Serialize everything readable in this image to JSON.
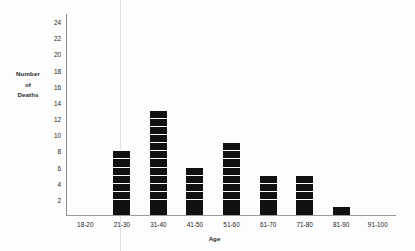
{
  "chart_data": {
    "type": "bar",
    "title": "",
    "xlabel": "Age",
    "ylabel": "Number of Deaths",
    "ylabel_lines": [
      "Number",
      "of",
      "Deaths"
    ],
    "categories": [
      "18-20",
      "21-30",
      "31-40",
      "41-50",
      "51-60",
      "61-70",
      "71-80",
      "81-90",
      "91-100"
    ],
    "values": [
      0,
      8,
      13,
      6,
      9,
      5,
      5,
      1,
      0
    ],
    "yticks": [
      2,
      4,
      6,
      8,
      10,
      12,
      14,
      16,
      18,
      20,
      22,
      24
    ],
    "ylim": [
      0,
      25
    ],
    "grid": false,
    "legend": false,
    "bar_style": "segmented-blocks",
    "bar_color": "#111111",
    "axis_color": "#8c8c8c"
  }
}
